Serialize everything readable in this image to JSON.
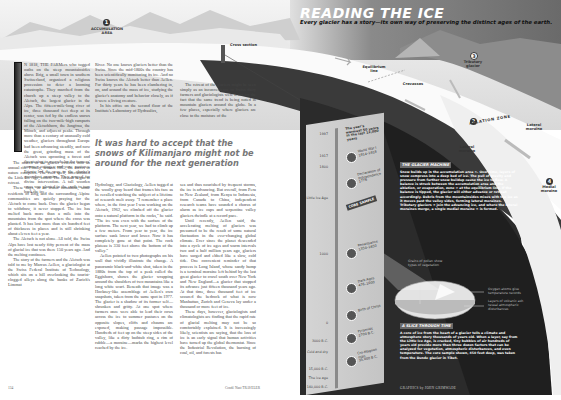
{
  "header": {
    "title": "READING THE ICE",
    "subtitle": "Every glacier has a story—its own way of preserving the distinct ages of the earth."
  },
  "diagram_labels": {
    "accumulation": {
      "number": "1",
      "text": "ACCUMULATION AREA"
    },
    "cross_section": "Cross section",
    "equilibrium_line": "Equilibrium line",
    "crevasses": "Crevasses",
    "tributary": {
      "number": "3",
      "text": "Tributary glacier"
    },
    "ablation": {
      "number": "2",
      "text": "ABLATION ZONE"
    },
    "lateral_moraine_1": "Lateral moraine",
    "lateral_moraine_2": "Lateral moraine",
    "medial": {
      "number": "4",
      "text": "Medial moraine"
    }
  },
  "article": {
    "col1": [
      "N 1818, THE FARMers who tugged oaths on the steep mountainsides above Brig, a small town in southern Switzerland, organized a religious procession to deter a looming catastrophe. They marched from the church up a steep valley to the Aletsch, the largest glacier in the Alps. The fifteen-mile-long river of ice, three thousand feet deep at its center, was fed by the endless snows falling on the two-mile-high ramparts of the Aletschhorn, the Jungfrau, the Mönch, and adjacent peaks. Through more than a century of unusually cold weather, glaciers throughout Europe had been advancing steadily, and now the great, grinding mass of the Aletsch was uprooting a forest and threatening to overwhelm the farmers' summer cottages and cow pastures. Priests led the way to the glacier's groundout moraine. They prayed for divine intervention. A tall wooden cross was planted in the earth to turn back the ice.",
      "The march to the glacier evolved into an annual rite. Finally, around 1865, the forces of nature complied. The cold spell, later dubbed the Little Ice Age, ended. The Aletsch began to retreat.",
      "These days, in an ironic turnabout, some residents of Brig and the surrounding Alpine communities are quietly praying for the Aletsch to come back. Once the glacier began to withdraw, it never stopped. The ice has melted back more than a mile into the mountains from the spot where the cross was planted. It has lost more than six hundred feet of thickness in places and is still shrinking about eleven feet a year.",
      "The Aletsch is not alone. All told, the Swiss Alps have lost nearly fifty percent of the mass of glacial ice that was there 150 years ago. And the melting continues.",
      "The story of the farmers and the Aletsch was told to me by Marcus Aellen, a glaciologist at the Swiss Federal Institute of Technology, which sits on a hill overlooking the tourist-clogged alleys along the banks of Zurich's Limmat"
    ],
    "col2_top": [
      "River. No one knows glaciers better than the Swiss. Since the mid-1800s the country has been scientifically monitoring its ice. And no Swiss knows the Aletsch better than Aellen. For thirty years he has been clambering in, on, and around the mass of ice, studying the glacier's anatomy and behavior closely, as if it were a living creature.",
      "In his office on the second floor of the Institute's Laboratory of Hydraulics,"
    ],
    "col3_top": [
      "The retreat of the glaciers might be seen simply as an inconvenience to Swiss dairy farmers and glaciologists were it not for the fact that the same trend is being noted in mountain glaciers around the globe. In a few places, especially where glaciers are close to the moisture of the"
    ],
    "pull_quote": "It was hard to accept that the snows of Kilimanjaro might not be around for the next generation",
    "col2_bottom": [
      "Hydrology, and Glaciology, Aellen tugged at the woolly gray beard that frames his face as he recalled watching the subject of a lifetime of research melt away. \"I remember a place where, in the first year I was working on the Aletsch, 1962, we climbed off the glacier onto a natural platform in the rocks,\" he said. \"The ice was even with the surface of the platform. The next year, we had to climb up a few meters. From year to year, the ice surface sank lower and lower. Now it has completely gone at that point. The rock plateau is 330 feet above the bottom of the valley.\"",
      "Aellen pointed to two photographs on his wall that vividly illustrate the change. A panoramic black-and-white shot, taken in the 1880s from the top of a peak called the Eggishorn, shows the glacier wrapping around the shoulders of two mountains like a long white scarf. Beneath that image was a Hockney-like assemblage of Aellen's own snapshots, taken from the same spot in 1977. The glacier is a shadow of its former self—shrunken and gritty. At one spot where farmers once were able to lead their cows across the ice to summer pastures on the opposite slopes, cliffs and chasms are exposed, making passage impossible. Hundreds of feet up on the steep sides of the valley, like a dirty bathtub ring, a rim of rubble—a moraine—marks the highest level reached by the ice."
    ],
    "col3_bottom": [
      "sea and thus nourished by frequent storms, the ice is advancing. But overall, from Peru to New Zealand, from Kenya to Indonesia, from Canada to China, independent research teams have sounded a chorus of alarm as ice caps and serpentine valley glaciers dwindle at a record pace.",
      "Until recently, Aellen said, the accelerating melting of glaciers was presumed to be the result of some natural fluctuation in the ever-changing global climate. Ever since the planet descended into a cycle of ice ages and warm intervals two and a half million years ago, glaciers have surged and ebbed like a slow, cold tide. One convenient reminder of that process is Long Island, whose sandy hump is a terminal moraine left behind by the last great glacier to crawl south over New York and New England—a glacier that stopped its advance just fifteen thousand years ago. At that time, three thousand feet of ice scoured the bedrock of what is now Manhattan, Zurich and Geneva lay under a thousand or more feet of ice.",
      "These days, however, glaciologists and climatologists are finding that the rapid rate of glacial melting may not be so comfortably explained. It is increasingly likely, scientists are saying, that the loss of ice is an early signal that human activities have turned up the global thermostat. Since the Industrial Revolution, the burning of coal, oil, and forests has"
    ],
    "folio_left": "134",
    "folio_right": "Condé Nast TRAVELER"
  },
  "core_sample": {
    "header": "The year's warmest 50 years in the last 12,000 years",
    "badge": "CORE SAMPLE",
    "ticks": [
      "1997",
      "1917",
      "1800",
      "Little Ice Age",
      "1000",
      "0",
      "3000 B.C.",
      "Cold and dry",
      "15,000 B.C.",
      "The ice age",
      "140,000 B.C."
    ],
    "events": [
      {
        "label": "World War I",
        "years": "1914–1918",
        "icon": "helmet-icon"
      },
      {
        "label": "Declaration of Independence",
        "years": "1776",
        "icon": "document-icon"
      },
      {
        "label": "Renaissance",
        "years": "1350–1650",
        "icon": "renaissance-icon"
      },
      {
        "label": "Dark Ages",
        "years": "476–1000",
        "icon": "wheel-icon"
      },
      {
        "label": "Birth of Christ",
        "years": "",
        "icon": "cross-icon"
      },
      {
        "label": "Pyramids",
        "years": "2700 B.C.",
        "icon": "pyramid-icon"
      },
      {
        "label": "Cro-Magnon man",
        "years": "35,000 B.C.",
        "icon": "skull-icon"
      }
    ]
  },
  "glacier_machine": {
    "title": "THE GLACIER MACHINE",
    "body": "Snow builds up in the accumulation area ①. Over time, layers of snow compress into a deep bed of ice. The pull of gravity and pressure from further snow buildup cause the ice to flow. A balance is struck between the accumulation area and the ablation, or evaporation, zone ② at the equilibrium line. If the balance is tipped, the glacier will either advance or retreat accordingly. Debris from the mountainsides mixes with the ice as it moves past the valley sides, forming lateral moraines. Tributary glaciers ③ join the advancing ice, and where the lateral moraines merge, a single medial moraine ④ is formed."
  },
  "slice_callouts": {
    "pollen": "Grains of pollen show types of vegetation",
    "oxygen": "Oxygen atoms give temperature records",
    "volcanic": "Layers of volcanic ash reveal atmospheric disturbances"
  },
  "slice_through_time": {
    "title": "A SLICE THROUGH TIME",
    "body": "A core of ice from the heart of a glacier tells a climate and atmosphere story thousands of years old. When a layer, say from the Little Ice Age, is cracked, tiny bubbles of air hundreds of years old provide more than three dozen factors that can be analyzed for vegetation, atmospheric disturbances, and even temperature. The core sample shown, 450 feet deep, was taken from the Dunde glacier in Tibet."
  },
  "credit": "GRAPHICS by JOHN GRIMWADE"
}
